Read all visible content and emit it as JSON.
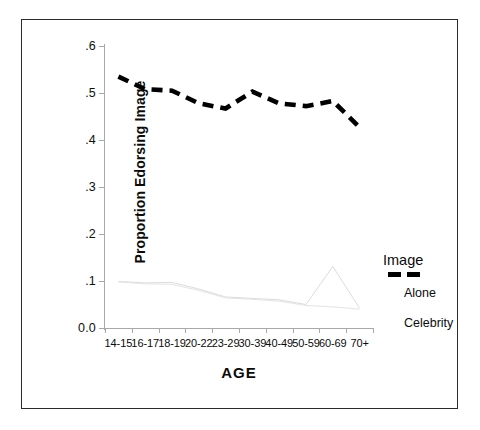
{
  "chart_data": {
    "type": "line",
    "title": "",
    "xlabel": "AGE",
    "ylabel": "Proportion Edorsing Image",
    "categories": [
      "14-15",
      "16-17",
      "18-19",
      "20-22",
      "23-29",
      "30-39",
      "40-49",
      "50-59",
      "60-69",
      "70+"
    ],
    "ylim": [
      0.0,
      0.6
    ],
    "yticks": [
      "0.0",
      ".1",
      ".2",
      ".3",
      ".4",
      ".5",
      ".6"
    ],
    "ytick_values": [
      0.0,
      0.1,
      0.2,
      0.3,
      0.4,
      0.5,
      0.6
    ],
    "grid": false,
    "legend_position": "right-middle",
    "series": [
      {
        "name": "Image",
        "style": "thick-dashed",
        "color": "#000000",
        "values": [
          0.535,
          0.508,
          0.505,
          0.478,
          0.467,
          0.503,
          0.478,
          0.472,
          0.483,
          0.427
        ]
      },
      {
        "name": "Alone",
        "style": "thin-solid-light",
        "color": "#dcdcdc",
        "values": [
          0.099,
          0.096,
          0.097,
          0.083,
          0.066,
          0.063,
          0.06,
          0.05,
          0.131,
          0.042
        ]
      },
      {
        "name": "Celebrity",
        "style": "thin-solid-light",
        "color": "#e4e4e4",
        "values": [
          0.098,
          0.094,
          0.093,
          0.08,
          0.064,
          0.061,
          0.057,
          0.048,
          0.045,
          0.04
        ]
      }
    ]
  },
  "legend": {
    "image_label": "Image",
    "alone_label": "Alone",
    "celebrity_label": "Celebrity"
  },
  "axes": {
    "x_title": "AGE",
    "y_title": "Proportion Edorsing Image"
  }
}
